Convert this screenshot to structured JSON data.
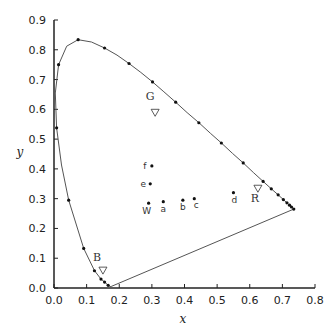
{
  "chart_data": {
    "type": "scatter",
    "title": "",
    "xlabel": "x",
    "ylabel": "y",
    "xlim": [
      0,
      0.8
    ],
    "ylim": [
      0,
      0.9
    ],
    "xticks": [
      "0.0",
      "0.1",
      "0.2",
      "0.3",
      "0.4",
      "0.5",
      "0.6",
      "0.7",
      "0.8"
    ],
    "yticks": [
      "0.0",
      "0.1",
      "0.2",
      "0.3",
      "0.4",
      "0.5",
      "0.6",
      "0.7",
      "0.8",
      "0.9"
    ],
    "grid": false,
    "spectral_locus": [
      [
        0.175,
        0.005
      ],
      [
        0.172,
        0.005
      ],
      [
        0.166,
        0.009
      ],
      [
        0.155,
        0.02
      ],
      [
        0.144,
        0.03
      ],
      [
        0.124,
        0.058
      ],
      [
        0.091,
        0.133
      ],
      [
        0.045,
        0.295
      ],
      [
        0.023,
        0.413
      ],
      [
        0.008,
        0.538
      ],
      [
        0.004,
        0.655
      ],
      [
        0.014,
        0.75
      ],
      [
        0.039,
        0.812
      ],
      [
        0.074,
        0.834
      ],
      [
        0.115,
        0.826
      ],
      [
        0.155,
        0.806
      ],
      [
        0.193,
        0.782
      ],
      [
        0.23,
        0.754
      ],
      [
        0.266,
        0.724
      ],
      [
        0.302,
        0.692
      ],
      [
        0.337,
        0.659
      ],
      [
        0.373,
        0.624
      ],
      [
        0.408,
        0.589
      ],
      [
        0.444,
        0.555
      ],
      [
        0.479,
        0.52
      ],
      [
        0.513,
        0.487
      ],
      [
        0.547,
        0.452
      ],
      [
        0.58,
        0.42
      ],
      [
        0.612,
        0.387
      ],
      [
        0.641,
        0.358
      ],
      [
        0.666,
        0.333
      ],
      [
        0.687,
        0.313
      ],
      [
        0.703,
        0.297
      ],
      [
        0.714,
        0.286
      ],
      [
        0.722,
        0.278
      ],
      [
        0.728,
        0.272
      ],
      [
        0.732,
        0.268
      ],
      [
        0.735,
        0.265
      ]
    ],
    "locus_markers": [
      [
        0.166,
        0.009
      ],
      [
        0.155,
        0.02
      ],
      [
        0.144,
        0.03
      ],
      [
        0.124,
        0.058
      ],
      [
        0.091,
        0.133
      ],
      [
        0.045,
        0.295
      ],
      [
        0.008,
        0.538
      ],
      [
        0.014,
        0.75
      ],
      [
        0.074,
        0.834
      ],
      [
        0.155,
        0.806
      ],
      [
        0.23,
        0.754
      ],
      [
        0.302,
        0.692
      ],
      [
        0.373,
        0.624
      ],
      [
        0.444,
        0.555
      ],
      [
        0.513,
        0.487
      ],
      [
        0.58,
        0.42
      ],
      [
        0.641,
        0.358
      ],
      [
        0.666,
        0.333
      ],
      [
        0.687,
        0.313
      ],
      [
        0.703,
        0.297
      ],
      [
        0.714,
        0.286
      ],
      [
        0.722,
        0.278
      ],
      [
        0.728,
        0.272
      ],
      [
        0.735,
        0.265
      ]
    ],
    "purple_line": [
      [
        0.175,
        0.005
      ],
      [
        0.735,
        0.265
      ]
    ],
    "points": [
      {
        "label": "f",
        "x": 0.3,
        "y": 0.41
      },
      {
        "label": "e",
        "x": 0.295,
        "y": 0.35
      },
      {
        "label": "W",
        "x": 0.29,
        "y": 0.285
      },
      {
        "label": "a",
        "x": 0.335,
        "y": 0.29
      },
      {
        "label": "b",
        "x": 0.395,
        "y": 0.295
      },
      {
        "label": "c",
        "x": 0.43,
        "y": 0.3
      },
      {
        "label": "d",
        "x": 0.55,
        "y": 0.32
      }
    ],
    "primaries": [
      {
        "label": "G",
        "x": 0.31,
        "y": 0.59
      },
      {
        "label": "R",
        "x": 0.625,
        "y": 0.335
      },
      {
        "label": "B",
        "x": 0.15,
        "y": 0.06
      }
    ]
  }
}
